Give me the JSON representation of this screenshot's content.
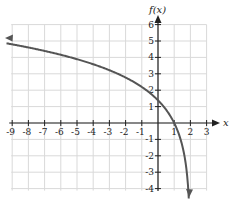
{
  "chart_data": {
    "type": "line",
    "title": "",
    "xlabel": "x",
    "ylabel": "f(x)",
    "xlim": [
      -9,
      3
    ],
    "ylim": [
      -4,
      6
    ],
    "grid": true,
    "x_ticks": [
      -9,
      -8,
      -7,
      -6,
      -5,
      -4,
      -3,
      -2,
      -1,
      1,
      2,
      3
    ],
    "y_ticks": [
      -4,
      -3,
      -2,
      -1,
      1,
      2,
      3,
      4,
      5,
      6
    ],
    "x_tick_labels": [
      "-9",
      "-8",
      "-7",
      "-6",
      "-5",
      "-4",
      "-3",
      "-2",
      "-1",
      "1",
      "2",
      "3"
    ],
    "y_tick_labels": [
      "-4",
      "-3",
      "-2",
      "-1",
      "1",
      "2",
      "3",
      "4",
      "5",
      "6"
    ],
    "series": [
      {
        "name": "f(x)",
        "color": "#555555",
        "x": [
          -9.3,
          -9,
          -8,
          -7,
          -6,
          -5,
          -4,
          -3,
          -2,
          -1,
          0,
          0.5,
          1,
          1.5,
          1.8,
          1.9,
          1.93
        ],
        "y": [
          4.85,
          4.8,
          4.61,
          4.39,
          4.16,
          3.89,
          3.58,
          3.22,
          2.77,
          2.2,
          1.39,
          0.81,
          0.0,
          -1.39,
          -3.22,
          -4.61,
          -5.3
        ],
        "arrows": [
          "left",
          "down"
        ],
        "x_intercept": 1,
        "y_intercept": 1.39
      }
    ]
  }
}
